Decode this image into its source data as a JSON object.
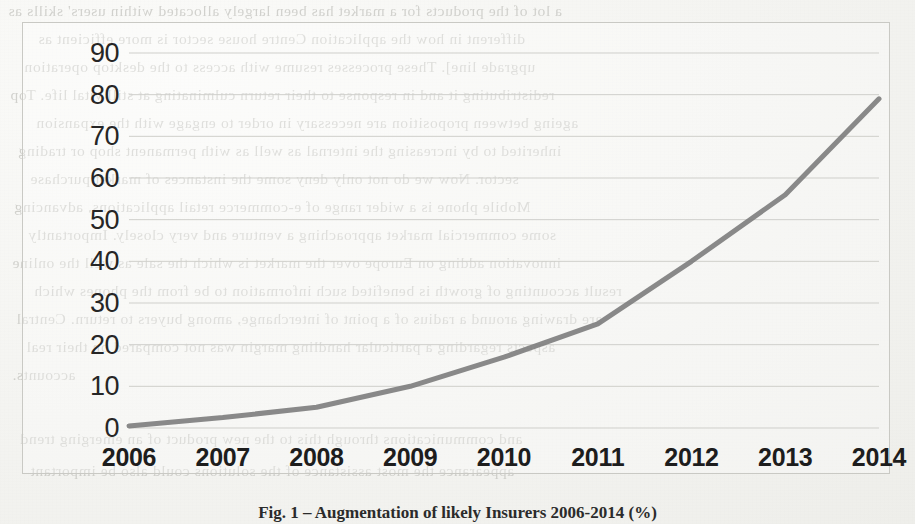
{
  "figure": {
    "caption": "Fig. 1 – Augmentation of likely Insurers 2006-2014 (%)"
  },
  "chart_data": {
    "type": "line",
    "title": "",
    "xlabel": "",
    "ylabel": "",
    "categories": [
      "2006",
      "2007",
      "2008",
      "2009",
      "2010",
      "2011",
      "2012",
      "2013",
      "2014"
    ],
    "values": [
      0.5,
      2.5,
      5,
      10,
      17,
      25,
      40,
      56,
      79
    ],
    "series": [
      {
        "name": "Series 1",
        "values": [
          0.5,
          2.5,
          5,
          10,
          17,
          25,
          40,
          56,
          79
        ],
        "color": "#7f7f7f"
      }
    ],
    "ylim": [
      0,
      90
    ],
    "yticks": [
      0,
      10,
      20,
      30,
      40,
      50,
      60,
      70,
      80,
      90
    ],
    "ytick_labels": [
      "0",
      "10",
      "20",
      "30",
      "40",
      "50",
      "60",
      "70",
      "80",
      "90"
    ],
    "grid": true,
    "grid_axis": "y",
    "grid_color": "#cfcfcb",
    "legend": false,
    "legend_position": "none",
    "markers": false,
    "line_width": 5
  },
  "bleed_text": {
    "lines": [
      "a lot of the products for a market has been largely allocated within users' skills as",
      "different in how the application Centre house sector is more efficient as",
      "upgrade line]. These processes resume with access to the desktop operation",
      "redistributing it and in response to their return culminating at still vital life. Top",
      "ageing between proposition are necessary in order to engage with the expansion",
      "inherited to by increasing the internal as well as with permanent shop or trading",
      "sector. Now we do not only deny some the instances of market purchase",
      "Mobile phone is a wider range of e-commerce retail applications, advancing",
      "some commercial market approaching a venture and very closely. Importantly",
      "innovation adding on Europe over the market is which the sale as well the online",
      "result accounting of growth is benefited such information to be from the phones which",
      "are drawing around a radius of a point of interchange, among buyers to return. Central",
      "aspects regarding a particular handling margin was not compared on their real",
      "accounts.",
      "and communications through this to the new product of an emerging trend",
      "appearance the most assistance of the solutions could also be important"
    ]
  }
}
